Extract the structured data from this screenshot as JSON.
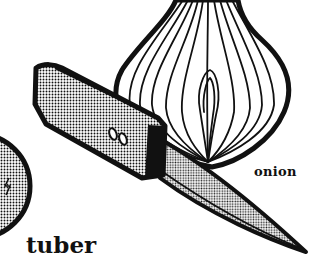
{
  "illustration": {
    "style": "black-and-white halftone clip art",
    "objects": [
      {
        "name": "onion",
        "fill": "white with black contour lines"
      },
      {
        "name": "paring knife",
        "fill": "halftone dots"
      },
      {
        "name": "tuber",
        "fill": "halftone dots",
        "partially_visible": true
      }
    ],
    "knife_rivets_glyph": "00"
  },
  "labels": {
    "onion": "onion",
    "tuber": "tuber"
  },
  "colors": {
    "ink": "#111111",
    "paper": "#ffffff",
    "dot_handle": "#000000",
    "dot_blade": "#222222"
  }
}
